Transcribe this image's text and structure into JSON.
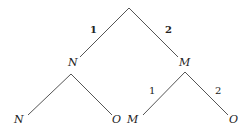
{
  "diagram": {
    "type": "tree",
    "root": {
      "label": "",
      "children": [
        {
          "edge_label": "1",
          "label": "N",
          "children": [
            {
              "edge_label": "",
              "label": "N"
            },
            {
              "edge_label": "",
              "label": "O"
            }
          ]
        },
        {
          "edge_label": "2",
          "label": "M",
          "children": [
            {
              "edge_label": "1",
              "label": "M"
            },
            {
              "edge_label": "2",
              "label": "O"
            }
          ]
        }
      ]
    },
    "labels": {
      "edge_root_left": "1",
      "edge_root_right": "2",
      "node_left": "N",
      "node_right": "M",
      "leaf_ll": "N",
      "leaf_lr": "O",
      "edge_right_left": "1",
      "edge_right_right": "2",
      "leaf_rl": "M",
      "leaf_rr": "O"
    }
  }
}
